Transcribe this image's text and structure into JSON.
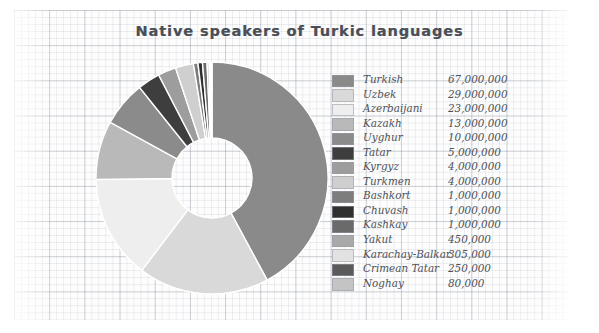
{
  "chart_data": {
    "type": "pie",
    "variant": "donut",
    "title": "Native speakers of Turkic languages",
    "xlabel": "",
    "ylabel": "",
    "legend_position": "right",
    "grid": true,
    "start_angle_deg": 0,
    "direction": "clockwise",
    "value_format": "comma-separated integers",
    "units": "native speakers",
    "total": 159085000,
    "categories": [
      "Turkish",
      "Uzbek",
      "Azerbaijani",
      "Kazakh",
      "Uyghur",
      "Tatar",
      "Kyrgyz",
      "Turkmen",
      "Bashkort",
      "Chuvash",
      "Kashkay",
      "Yakut",
      "Karachay-Balkar",
      "Crimean Tatar",
      "Noghay"
    ],
    "values": [
      67000000,
      29000000,
      23000000,
      13000000,
      10000000,
      5000000,
      4000000,
      4000000,
      1000000,
      1000000,
      1000000,
      450000,
      305000,
      250000,
      80000
    ],
    "value_labels": [
      "67,000,000",
      "29,000,000",
      "23,000,000",
      "13,000,000",
      "10,000,000",
      "5,000,000",
      "4,000,000",
      "4,000,000",
      "1,000,000",
      "1,000,000",
      "1,000,000",
      "450,000",
      "305,000",
      "250,000",
      "80,000"
    ],
    "colors": [
      "#8a8a8a",
      "#d9d9d9",
      "#eeeeee",
      "#b9b9b9",
      "#8b8b8b",
      "#3e3e3e",
      "#9d9d9d",
      "#cfcfcf",
      "#7d7d7d",
      "#2f2f2f",
      "#6a6a6a",
      "#a9a9a9",
      "#e2e2e2",
      "#5a5a5a",
      "#c4c4c4"
    ],
    "slice_order_note": "drawn clockwise from 12 o'clock in descending value order"
  },
  "legend": {
    "rows": [
      {
        "label": "Turkish",
        "value": "67,000,000",
        "color": "#8a8a8a"
      },
      {
        "label": "Uzbek",
        "value": "29,000,000",
        "color": "#d9d9d9"
      },
      {
        "label": "Azerbaijani",
        "value": "23,000,000",
        "color": "#eeeeee"
      },
      {
        "label": "Kazakh",
        "value": "13,000,000",
        "color": "#b9b9b9"
      },
      {
        "label": "Uyghur",
        "value": "10,000,000",
        "color": "#8b8b8b"
      },
      {
        "label": "Tatar",
        "value": "5,000,000",
        "color": "#3e3e3e"
      },
      {
        "label": "Kyrgyz",
        "value": "4,000,000",
        "color": "#9d9d9d"
      },
      {
        "label": "Turkmen",
        "value": "4,000,000",
        "color": "#cfcfcf"
      },
      {
        "label": "Bashkort",
        "value": "1,000,000",
        "color": "#7d7d7d"
      },
      {
        "label": "Chuvash",
        "value": "1,000,000",
        "color": "#2f2f2f"
      },
      {
        "label": "Kashkay",
        "value": "1,000,000",
        "color": "#6a6a6a"
      },
      {
        "label": "Yakut",
        "value": "450,000",
        "color": "#a9a9a9"
      },
      {
        "label": "Karachay-Balkar",
        "value": "305,000",
        "color": "#e2e2e2"
      },
      {
        "label": "Crimean Tatar",
        "value": "250,000",
        "color": "#5a5a5a"
      },
      {
        "label": "Noghay",
        "value": "80,000",
        "color": "#c4c4c4"
      }
    ]
  }
}
